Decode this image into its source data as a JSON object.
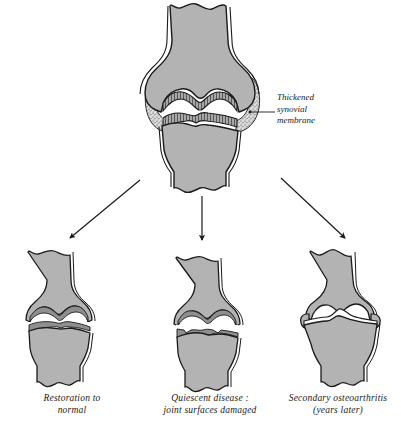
{
  "figure": {
    "background_color": "#ffffff",
    "bone_fill": "#b3b3b3",
    "outline_color": "#1a1a1a",
    "cartilage_fill": "#9a9a9a",
    "joint_space_color": "#ffffff",
    "synovium_fill": "#d8d8d8"
  },
  "annotations": {
    "synovial_membrane": {
      "text": "Thickened\nsynovial\nmembrane",
      "leader": "horizontal-line-to-joint"
    }
  },
  "arrows": [
    {
      "name": "arrow-to-restoration",
      "direction": "down-left"
    },
    {
      "name": "arrow-to-quiescent",
      "direction": "down"
    },
    {
      "name": "arrow-to-osteoarthritis",
      "direction": "down-right"
    }
  ],
  "panels": {
    "main": {
      "name": "active-rheumatoid-joint",
      "caption": ""
    },
    "bottom": [
      {
        "name": "restoration-to-normal",
        "caption": "Restoration to\nnormal",
        "joint_space": "normal",
        "cartilage": "intact"
      },
      {
        "name": "quiescent-disease",
        "caption": "Quiescent disease :\njoint surfaces damaged",
        "joint_space": "irregular",
        "cartilage": "damaged"
      },
      {
        "name": "secondary-osteoarthritis",
        "caption": "Secondary osteoarthritis\n(years later)",
        "joint_space": "narrowed",
        "cartilage": "lost"
      }
    ]
  }
}
